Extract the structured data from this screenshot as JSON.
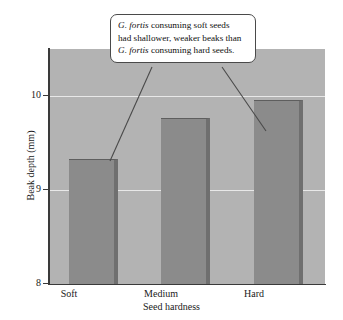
{
  "chart_data": {
    "type": "bar",
    "title": "",
    "categories": [
      "Soft",
      "Medium",
      "Hard"
    ],
    "values": [
      9.33,
      9.77,
      9.96
    ],
    "xlabel": "Seed hardness",
    "ylabel": "Beak depth (mm)",
    "ylim": [
      8,
      10.5
    ],
    "yticks": [
      "8",
      "9",
      "10"
    ],
    "ytick_values": [
      8,
      9,
      10
    ],
    "grid": true,
    "legend": "none",
    "annotations": [
      {
        "name": "callout",
        "line1_italic": "G. fortis",
        "line1_rest": " consuming soft seeds",
        "line2": "had shallower, weaker beaks than",
        "line3_italic": "G. fortis",
        "line3_rest": " consuming hard seeds.",
        "points_to": [
          "Soft",
          "Hard"
        ]
      }
    ],
    "colors": {
      "bar_fill": "#8b8b8b",
      "bar_shadow": "#6f6f6f",
      "plot_background": "#b3b3b3",
      "gridline": "#e8e8e8",
      "axis": "#3a3a3a",
      "callout_background": "#ffffff",
      "callout_border": "#4a4a4a",
      "text": "#101010"
    }
  },
  "axes": {
    "y_title": "Beak depth (mm)",
    "x_title": "Seed hardness",
    "ytick_10": "10",
    "ytick_9": "9",
    "ytick_8": "8",
    "xtick_soft": "Soft",
    "xtick_medium": "Medium",
    "xtick_hard": "Hard"
  }
}
